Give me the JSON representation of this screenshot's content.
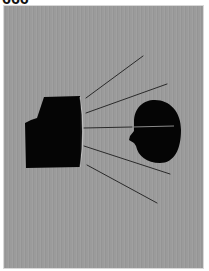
{
  "header": {
    "glyphs": "666"
  },
  "artwork": {
    "background_color": "#9b9b9b",
    "border_color": "#d8d8d8",
    "shape_color": "#050505",
    "line_color": "#2a2a2a",
    "line_through_head_color": "#8a8a8a",
    "elements": {
      "monitor": "black television/monitor silhouette with curved screen on right",
      "head": "black human head silhouette in profile facing left",
      "rays": 5
    }
  }
}
